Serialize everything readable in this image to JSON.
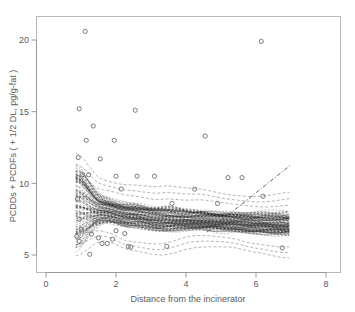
{
  "figure": {
    "caption_strip": "",
    "background_color": "#ffffff",
    "frame_color": "#b9b9bd"
  },
  "chart_data": {
    "type": "scatter",
    "title": "",
    "xlabel": "Distance from the incinerator",
    "ylabel": "PCDDs + PCDFs ( + 1/2 DL, pg/g-fat )",
    "xlim": [
      -0.3,
      8.4
    ],
    "ylim": [
      3.4,
      21.6
    ],
    "xticks": [
      0,
      2,
      4,
      6,
      8
    ],
    "xtick_labels": [
      "0",
      "2",
      "4",
      "6",
      "8"
    ],
    "yticks": [
      5,
      10,
      15,
      20
    ],
    "ytick_labels": [
      "5",
      "10",
      "15",
      "20"
    ],
    "grid": false,
    "legend": "none",
    "marker": "open-circle",
    "points": [
      [
        1.12,
        20.6
      ],
      [
        0.95,
        15.2
      ],
      [
        2.55,
        15.1
      ],
      [
        1.35,
        14.0
      ],
      [
        1.15,
        13.0
      ],
      [
        1.95,
        13.0
      ],
      [
        6.15,
        19.9
      ],
      [
        4.55,
        13.3
      ],
      [
        0.92,
        11.8
      ],
      [
        1.55,
        11.7
      ],
      [
        1.05,
        10.6
      ],
      [
        1.22,
        10.6
      ],
      [
        2.0,
        10.5
      ],
      [
        2.6,
        10.5
      ],
      [
        3.1,
        10.5
      ],
      [
        5.2,
        10.4
      ],
      [
        5.6,
        10.4
      ],
      [
        2.15,
        9.6
      ],
      [
        4.25,
        9.6
      ],
      [
        6.2,
        9.1
      ],
      [
        0.9,
        8.9
      ],
      [
        3.6,
        8.6
      ],
      [
        4.9,
        8.6
      ],
      [
        0.95,
        7.5
      ],
      [
        1.4,
        7.4
      ],
      [
        2.1,
        7.3
      ],
      [
        0.88,
        6.3
      ],
      [
        1.5,
        6.2
      ],
      [
        1.9,
        6.1
      ],
      [
        1.6,
        5.8
      ],
      [
        1.75,
        5.8
      ],
      [
        2.35,
        5.6
      ],
      [
        2.42,
        5.55
      ],
      [
        3.45,
        5.6
      ],
      [
        1.25,
        5.05
      ],
      [
        1.0,
        6.8
      ],
      [
        2.0,
        6.7
      ],
      [
        1.3,
        6.45
      ],
      [
        2.25,
        6.5
      ],
      [
        0.95,
        5.95
      ],
      [
        6.75,
        5.5
      ]
    ],
    "band": {
      "description": "bootstrap smoothing spline replicates, dashed",
      "n_curves": 120,
      "x_start": 0.85,
      "x_end": 6.95,
      "center": [
        [
          0.85,
          9.0
        ],
        [
          1.6,
          8.2
        ],
        [
          2.4,
          7.8
        ],
        [
          3.3,
          7.5
        ],
        [
          4.2,
          7.4
        ],
        [
          5.2,
          7.3
        ],
        [
          6.0,
          7.2
        ],
        [
          6.95,
          7.1
        ]
      ],
      "upper": [
        [
          0.85,
          10.4
        ],
        [
          1.6,
          9.5
        ],
        [
          2.4,
          9.3
        ],
        [
          3.3,
          9.0
        ],
        [
          4.2,
          8.7
        ],
        [
          5.2,
          8.5
        ],
        [
          6.0,
          8.5
        ],
        [
          6.95,
          8.6
        ]
      ],
      "lower": [
        [
          0.85,
          6.3
        ],
        [
          1.6,
          6.6
        ],
        [
          2.4,
          6.1
        ],
        [
          3.3,
          5.9
        ],
        [
          4.2,
          6.2
        ],
        [
          5.2,
          6.1
        ],
        [
          6.0,
          5.9
        ],
        [
          6.95,
          5.7
        ]
      ]
    },
    "trend_line": {
      "style": "dash-dot",
      "x": [
        4.6,
        7.0
      ],
      "y": [
        6.6,
        11.3
      ]
    },
    "annotations": []
  }
}
